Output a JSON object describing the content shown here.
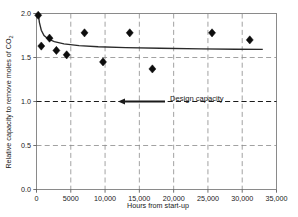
{
  "chart_data": {
    "type": "scatter",
    "title": "",
    "xlabel": "Hours from start-up",
    "ylabel": "Relative capacity to remove moles of CO2",
    "ylabel_main": "Relative capacity to remove moles of CO",
    "ylabel_sub": "2",
    "xlim": [
      0,
      35000
    ],
    "ylim": [
      0.0,
      2.0
    ],
    "grid": true,
    "legend_position": "none",
    "x_ticks": [
      0,
      5000,
      10000,
      15000,
      20000,
      25000,
      30000,
      35000
    ],
    "x_tick_labels": [
      "0",
      "5000",
      "10,000",
      "15,000",
      "20,000",
      "25,000",
      "30,000",
      "35,000"
    ],
    "y_ticks": [
      0.0,
      0.5,
      1.0,
      1.5,
      2.0
    ],
    "y_tick_labels": [
      "0.0",
      "0.5",
      "1.0",
      "1.5",
      "2.0"
    ],
    "series": [
      {
        "name": "Measured relative capacity",
        "marker": "diamond",
        "color": "#0d0d0d",
        "points": [
          {
            "x": 250,
            "y": 1.98
          },
          {
            "x": 700,
            "y": 1.63
          },
          {
            "x": 1900,
            "y": 1.72
          },
          {
            "x": 2900,
            "y": 1.58
          },
          {
            "x": 4400,
            "y": 1.53
          },
          {
            "x": 7000,
            "y": 1.78
          },
          {
            "x": 9700,
            "y": 1.45
          },
          {
            "x": 13600,
            "y": 1.78
          },
          {
            "x": 16900,
            "y": 1.37
          },
          {
            "x": 25600,
            "y": 1.78
          },
          {
            "x": 31100,
            "y": 1.7
          }
        ]
      }
    ],
    "fit_curve": {
      "name": "Fitted decay trend",
      "color": "#2a2a2a",
      "points": [
        {
          "x": 260,
          "y": 2.0
        },
        {
          "x": 420,
          "y": 1.9
        },
        {
          "x": 700,
          "y": 1.81
        },
        {
          "x": 1100,
          "y": 1.75
        },
        {
          "x": 1700,
          "y": 1.71
        },
        {
          "x": 2600,
          "y": 1.68
        },
        {
          "x": 4000,
          "y": 1.655
        },
        {
          "x": 6200,
          "y": 1.635
        },
        {
          "x": 9000,
          "y": 1.622
        },
        {
          "x": 13000,
          "y": 1.612
        },
        {
          "x": 18000,
          "y": 1.605
        },
        {
          "x": 24000,
          "y": 1.598
        },
        {
          "x": 29000,
          "y": 1.594
        },
        {
          "x": 33000,
          "y": 1.592
        }
      ]
    },
    "annotations": [
      {
        "name": "design-capacity",
        "label": "Design capacity",
        "y_value": 1.0,
        "x_from": 0,
        "x_to": 35000,
        "style": "dashed-with-arrow"
      }
    ]
  }
}
